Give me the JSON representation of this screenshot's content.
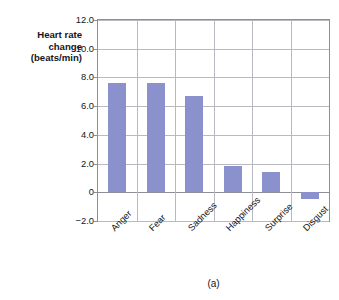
{
  "figure": {
    "caption": "(a)",
    "top_edge_artifact": "",
    "bar_color": "#8b91cd",
    "axis_color": "#8e8e96",
    "grid_color": "#b9b9c2"
  },
  "axis_title": {
    "line1": "Heart rate",
    "line2": "change",
    "line3": "(beats/min)"
  },
  "chart_data": {
    "type": "bar",
    "title": "",
    "subtitle": "",
    "xlabel": "",
    "ylabel": "Heart rate change (beats/min)",
    "categories": [
      "Anger",
      "Fear",
      "Sadness",
      "Happiness",
      "Surprise",
      "Disgust"
    ],
    "values": [
      7.6,
      7.6,
      6.7,
      1.8,
      1.4,
      -0.5
    ],
    "series": [
      {
        "name": "Heart rate change",
        "values": [
          7.6,
          7.6,
          6.7,
          1.8,
          1.4,
          -0.5
        ]
      }
    ],
    "ylim": [
      -2.0,
      12.0
    ],
    "ytick_values": [
      12.0,
      10.0,
      8.0,
      6.0,
      4.0,
      2.0,
      0,
      -2.0
    ],
    "ytick_labels": [
      "12.0",
      "10.0",
      "8.0",
      "6.0",
      "4.0",
      "2.0",
      "0",
      "−2.0"
    ],
    "grid": "horizontal-and-vertical",
    "legend": "none",
    "annotations": [
      "(a)"
    ],
    "bar_color": "#8b91cd"
  }
}
